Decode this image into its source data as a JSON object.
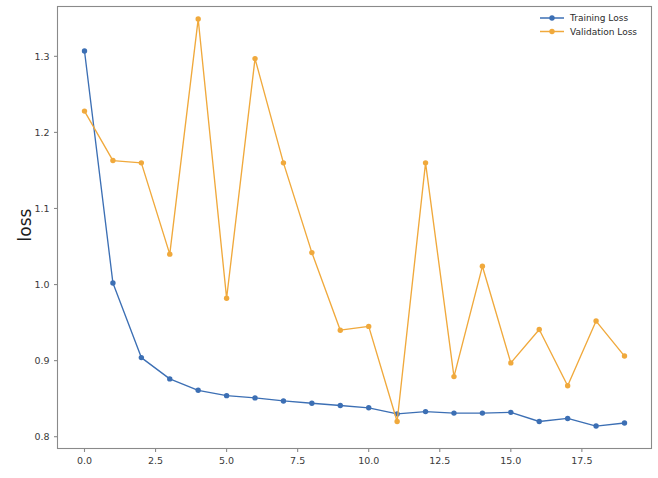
{
  "chart_data": {
    "type": "line",
    "title": "",
    "subtitle": "",
    "xlabel": "",
    "ylabel": "loss",
    "x": [
      0,
      1,
      2,
      3,
      4,
      5,
      6,
      7,
      8,
      9,
      10,
      11,
      12,
      13,
      14,
      15,
      16,
      17,
      18,
      19
    ],
    "series": [
      {
        "name": "Training Loss",
        "color": "#3c6fb4",
        "marker": "circle",
        "values": [
          1.307,
          1.002,
          0.904,
          0.876,
          0.861,
          0.854,
          0.851,
          0.847,
          0.844,
          0.841,
          0.838,
          0.83,
          0.833,
          0.831,
          0.831,
          0.832,
          0.82,
          0.824,
          0.814,
          0.818
        ]
      },
      {
        "name": "Validation Loss",
        "color": "#f0a93c",
        "marker": "circle",
        "values": [
          1.228,
          1.163,
          1.16,
          1.04,
          1.349,
          0.982,
          1.297,
          1.16,
          1.042,
          0.94,
          0.945,
          0.82,
          1.16,
          0.879,
          1.024,
          0.897,
          0.941,
          0.867,
          0.952,
          0.906
        ]
      }
    ],
    "xticks": [
      "0.0",
      "2.5",
      "5.0",
      "7.5",
      "10.0",
      "12.5",
      "15.0",
      "17.5"
    ],
    "xtick_values": [
      0.0,
      2.5,
      5.0,
      7.5,
      10.0,
      12.5,
      15.0,
      17.5
    ],
    "yticks": [
      "1.3",
      "1.2",
      "1.1",
      "1.0",
      "0.9",
      "0.8"
    ],
    "ytick_values": [
      1.3,
      1.2,
      1.1,
      1.0,
      0.9,
      0.8
    ],
    "xlim": [
      -0.95,
      19.95
    ],
    "ylim": [
      0.7845,
      1.3655
    ],
    "grid": false,
    "legend_position": "top-right",
    "legend": [
      "Training Loss",
      "Validation Loss"
    ]
  },
  "axes": {
    "ylabel": "loss"
  },
  "legend": {
    "entries": [
      {
        "label": "Training Loss",
        "color": "#3c6fb4"
      },
      {
        "label": "Validation Loss",
        "color": "#f0a93c"
      }
    ]
  }
}
